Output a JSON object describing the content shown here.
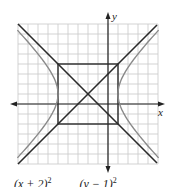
{
  "figure": {
    "axis_labels": {
      "x": "x",
      "y": "y"
    },
    "equation_partial": {
      "left": "(x + 2)",
      "right": "(y − 1)",
      "exponent": "2"
    },
    "grid": {
      "xmin": -9,
      "xmax": 5,
      "ymin": -6,
      "ymax": 8,
      "step": 1
    },
    "hyperbola": {
      "center": [
        -2,
        1
      ],
      "a": 3,
      "b": 3,
      "orientation": "horizontal"
    },
    "asymptotes": [
      "y - 1 = (x + 2)",
      "y - 1 = -(x + 2)"
    ],
    "central_box": {
      "x": [
        -5,
        1
      ],
      "y": [
        -2,
        4
      ]
    },
    "colors": {
      "grid": "#c8c8c8",
      "axes": "#222222",
      "asymptote": "#2a2a2a",
      "hyperbola": "#8a8a8a",
      "box": "#2a2a2a"
    }
  }
}
